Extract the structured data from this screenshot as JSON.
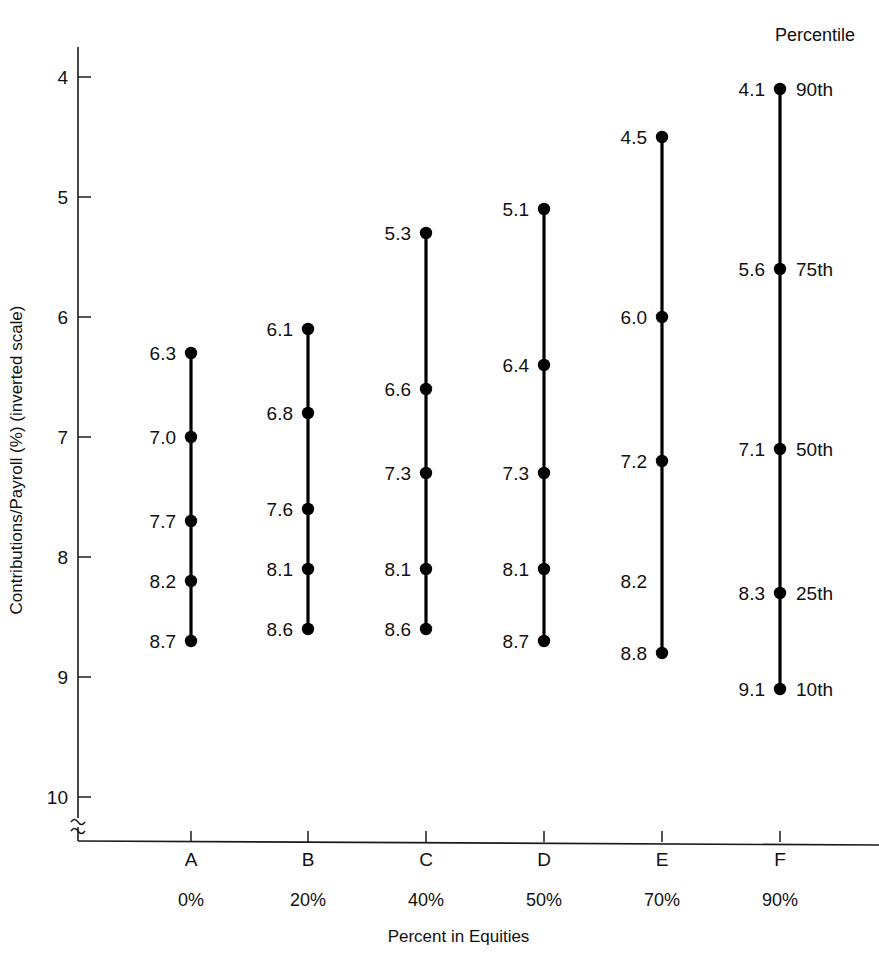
{
  "chart_data": {
    "type": "scatter",
    "title": "",
    "xlabel": "Percent in Equities",
    "ylabel": "Contributions/Payroll (%) (inverted scale)",
    "inverted_y": true,
    "ylim": [
      4,
      10
    ],
    "yticks": [
      "4",
      "5",
      "6",
      "7",
      "8",
      "9",
      "10"
    ],
    "grid": false,
    "axis_break": true,
    "legend_position": "top-right",
    "legend_title": "Percentile",
    "percentile_labels": [
      "90th",
      "75th",
      "50th",
      "25th",
      "10th"
    ],
    "categories": [
      "A",
      "B",
      "C",
      "D",
      "E",
      "F"
    ],
    "category_sublabels": [
      "0%",
      "20%",
      "40%",
      "50%",
      "70%",
      "90%"
    ],
    "series": [
      {
        "name": "90th",
        "values": [
          6.3,
          6.1,
          5.3,
          5.1,
          4.5,
          4.1
        ]
      },
      {
        "name": "75th",
        "values": [
          7.0,
          6.8,
          6.6,
          6.4,
          6.0,
          5.6
        ]
      },
      {
        "name": "50th",
        "values": [
          7.7,
          7.6,
          7.3,
          7.3,
          7.2,
          7.1
        ]
      },
      {
        "name": "25th",
        "values": [
          8.2,
          8.1,
          8.1,
          8.1,
          8.2,
          8.3
        ]
      },
      {
        "name": "10th",
        "values": [
          8.7,
          8.6,
          8.6,
          8.7,
          8.8,
          9.1
        ]
      }
    ],
    "groups": [
      {
        "letter": "A",
        "equities": "0%",
        "points": [
          {
            "label": "6.3",
            "value": 6.3,
            "percentile": "90th",
            "marker": true
          },
          {
            "label": "7.0",
            "value": 7.0,
            "percentile": "75th",
            "marker": true
          },
          {
            "label": "7.7",
            "value": 7.7,
            "percentile": "50th",
            "marker": true
          },
          {
            "label": "8.2",
            "value": 8.2,
            "percentile": "25th",
            "marker": true
          },
          {
            "label": "8.7",
            "value": 8.7,
            "percentile": "10th",
            "marker": true
          }
        ]
      },
      {
        "letter": "B",
        "equities": "20%",
        "points": [
          {
            "label": "6.1",
            "value": 6.1,
            "percentile": "90th",
            "marker": true
          },
          {
            "label": "6.8",
            "value": 6.8,
            "percentile": "75th",
            "marker": true
          },
          {
            "label": "7.6",
            "value": 7.6,
            "percentile": "50th",
            "marker": true
          },
          {
            "label": "8.1",
            "value": 8.1,
            "percentile": "25th",
            "marker": true
          },
          {
            "label": "8.6",
            "value": 8.6,
            "percentile": "10th",
            "marker": true
          }
        ]
      },
      {
        "letter": "C",
        "equities": "40%",
        "points": [
          {
            "label": "5.3",
            "value": 5.3,
            "percentile": "90th",
            "marker": true
          },
          {
            "label": "6.6",
            "value": 6.6,
            "percentile": "75th",
            "marker": true
          },
          {
            "label": "7.3",
            "value": 7.3,
            "percentile": "50th",
            "marker": true
          },
          {
            "label": "8.1",
            "value": 8.1,
            "percentile": "25th",
            "marker": true
          },
          {
            "label": "8.6",
            "value": 8.6,
            "percentile": "10th",
            "marker": true
          }
        ]
      },
      {
        "letter": "D",
        "equities": "50%",
        "points": [
          {
            "label": "5.1",
            "value": 5.1,
            "percentile": "90th",
            "marker": true
          },
          {
            "label": "6.4",
            "value": 6.4,
            "percentile": "75th",
            "marker": true
          },
          {
            "label": "7.3",
            "value": 7.3,
            "percentile": "50th",
            "marker": true
          },
          {
            "label": "8.1",
            "value": 8.1,
            "percentile": "25th",
            "marker": true
          },
          {
            "label": "8.7",
            "value": 8.7,
            "percentile": "10th",
            "marker": true
          }
        ]
      },
      {
        "letter": "E",
        "equities": "70%",
        "points": [
          {
            "label": "4.5",
            "value": 4.5,
            "percentile": "90th",
            "marker": true
          },
          {
            "label": "6.0",
            "value": 6.0,
            "percentile": "75th",
            "marker": true
          },
          {
            "label": "7.2",
            "value": 7.2,
            "percentile": "50th",
            "marker": true
          },
          {
            "label": "8.2",
            "value": 8.2,
            "percentile": "25th",
            "marker": false
          },
          {
            "label": "8.8",
            "value": 8.8,
            "percentile": "10th",
            "marker": true
          }
        ]
      },
      {
        "letter": "F",
        "equities": "90%",
        "points": [
          {
            "label": "4.1",
            "value": 4.1,
            "percentile": "90th",
            "marker": true
          },
          {
            "label": "5.6",
            "value": 5.6,
            "percentile": "75th",
            "marker": true
          },
          {
            "label": "7.1",
            "value": 7.1,
            "percentile": "50th",
            "marker": true
          },
          {
            "label": "8.3",
            "value": 8.3,
            "percentile": "25th",
            "marker": true
          },
          {
            "label": "9.1",
            "value": 9.1,
            "percentile": "10th",
            "marker": true
          }
        ]
      }
    ]
  },
  "layout": {
    "axis_x": 78,
    "axis_top": 47,
    "axis_bottom": 818,
    "baseline_y": 841,
    "baseline_right": 879,
    "y_at_4": 77,
    "px_per_unit": 120,
    "group_x": [
      191,
      308,
      426,
      544,
      662,
      780
    ],
    "letter_y": 866,
    "pct_y": 906,
    "xtitle_y": 942,
    "legend_x": 815,
    "legend_y": 41
  },
  "colors": {
    "ink": "#111111",
    "line": "#000000",
    "background": "#ffffff"
  }
}
